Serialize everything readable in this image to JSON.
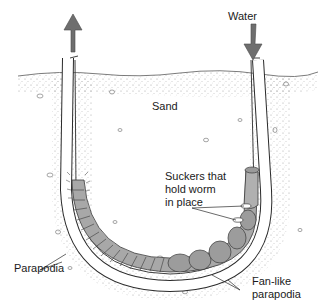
{
  "diagram": {
    "colors": {
      "background": "#ffffff",
      "arrow": "#6e6e6e",
      "sand_stipple": "#8a8a8a",
      "worm_fill": "#a8a8a8",
      "worm_outline": "#3a3a3a",
      "tube_wall": "#ffffff",
      "line": "#2a2a2a"
    },
    "labels": {
      "water": "Water",
      "sand": "Sand",
      "suckers": "Suckers that\nhold worm\nin place",
      "parapodia": "Parapodia",
      "fan_parapodia": "Fan-like\nparapodia"
    },
    "arrows": [
      {
        "name": "outflow-arrow",
        "direction": "up",
        "position": "left tube opening"
      },
      {
        "name": "inflow-arrow",
        "direction": "down",
        "position": "right tube opening"
      }
    ]
  }
}
